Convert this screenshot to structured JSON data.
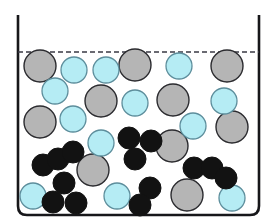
{
  "figure": {
    "type": "scientific-diagram",
    "width": 279,
    "height": 223,
    "background_color": "#ffffff"
  },
  "container": {
    "name": "beaker",
    "left_wall_x": 18,
    "right_wall_x": 259,
    "top_y": 15,
    "bottom_y": 215,
    "corner_radius": 9,
    "stroke_color": "#17171a",
    "stroke_width": 2.6,
    "fill_color": "#ffffff"
  },
  "liquid_level": {
    "name": "liquid-level-dashed-line",
    "y": 52,
    "x_start": 18,
    "x_end": 259,
    "stroke_color": "#3a3a44",
    "stroke_width": 1.6,
    "dash_pattern": "5,3"
  },
  "legend_colors": {
    "gray_particle_fill": "#b5b5b5",
    "gray_particle_stroke": "#2b2b2f",
    "cyan_particle_fill": "#b5ecf4",
    "cyan_particle_stroke": "#5d8e9c",
    "black_particle_fill": "#121212",
    "black_particle_stroke": "#121212"
  },
  "particles": {
    "gray": [
      {
        "cx": 40,
        "cy": 66,
        "r": 16
      },
      {
        "cx": 135,
        "cy": 65,
        "r": 16
      },
      {
        "cx": 227,
        "cy": 66,
        "r": 16
      },
      {
        "cx": 101,
        "cy": 101,
        "r": 16
      },
      {
        "cx": 173,
        "cy": 100,
        "r": 16
      },
      {
        "cx": 40,
        "cy": 122,
        "r": 16
      },
      {
        "cx": 232,
        "cy": 127,
        "r": 16
      },
      {
        "cx": 172,
        "cy": 146,
        "r": 16
      },
      {
        "cx": 93,
        "cy": 170,
        "r": 16
      },
      {
        "cx": 187,
        "cy": 195,
        "r": 16
      }
    ],
    "cyan": [
      {
        "cx": 74,
        "cy": 70,
        "r": 13
      },
      {
        "cx": 106,
        "cy": 70,
        "r": 13
      },
      {
        "cx": 179,
        "cy": 66,
        "r": 13
      },
      {
        "cx": 55,
        "cy": 91,
        "r": 13
      },
      {
        "cx": 135,
        "cy": 103,
        "r": 13
      },
      {
        "cx": 224,
        "cy": 101,
        "r": 13
      },
      {
        "cx": 73,
        "cy": 119,
        "r": 13
      },
      {
        "cx": 193,
        "cy": 126,
        "r": 13
      },
      {
        "cx": 101,
        "cy": 143,
        "r": 13
      },
      {
        "cx": 33,
        "cy": 196,
        "r": 13
      },
      {
        "cx": 117,
        "cy": 196,
        "r": 13
      },
      {
        "cx": 232,
        "cy": 198,
        "r": 13
      }
    ],
    "black_clusters": [
      {
        "name": "trimer-center",
        "circles": [
          {
            "cx": 129,
            "cy": 138,
            "r": 11
          },
          {
            "cx": 151,
            "cy": 141,
            "r": 11
          },
          {
            "cx": 135,
            "cy": 159,
            "r": 11
          }
        ]
      },
      {
        "name": "chain-left",
        "circles": [
          {
            "cx": 43,
            "cy": 165,
            "r": 11
          },
          {
            "cx": 58,
            "cy": 159,
            "r": 11
          },
          {
            "cx": 73,
            "cy": 152,
            "r": 11
          }
        ]
      },
      {
        "name": "trimer-lower-left",
        "circles": [
          {
            "cx": 64,
            "cy": 183,
            "r": 11
          },
          {
            "cx": 53,
            "cy": 202,
            "r": 11
          },
          {
            "cx": 76,
            "cy": 203,
            "r": 11
          }
        ]
      },
      {
        "name": "dimer-bottom-center",
        "circles": [
          {
            "cx": 150,
            "cy": 188,
            "r": 11
          },
          {
            "cx": 140,
            "cy": 205,
            "r": 11
          }
        ]
      },
      {
        "name": "chain-right",
        "circles": [
          {
            "cx": 194,
            "cy": 168,
            "r": 11
          },
          {
            "cx": 212,
            "cy": 168,
            "r": 11
          },
          {
            "cx": 226,
            "cy": 178,
            "r": 11
          }
        ]
      }
    ]
  }
}
